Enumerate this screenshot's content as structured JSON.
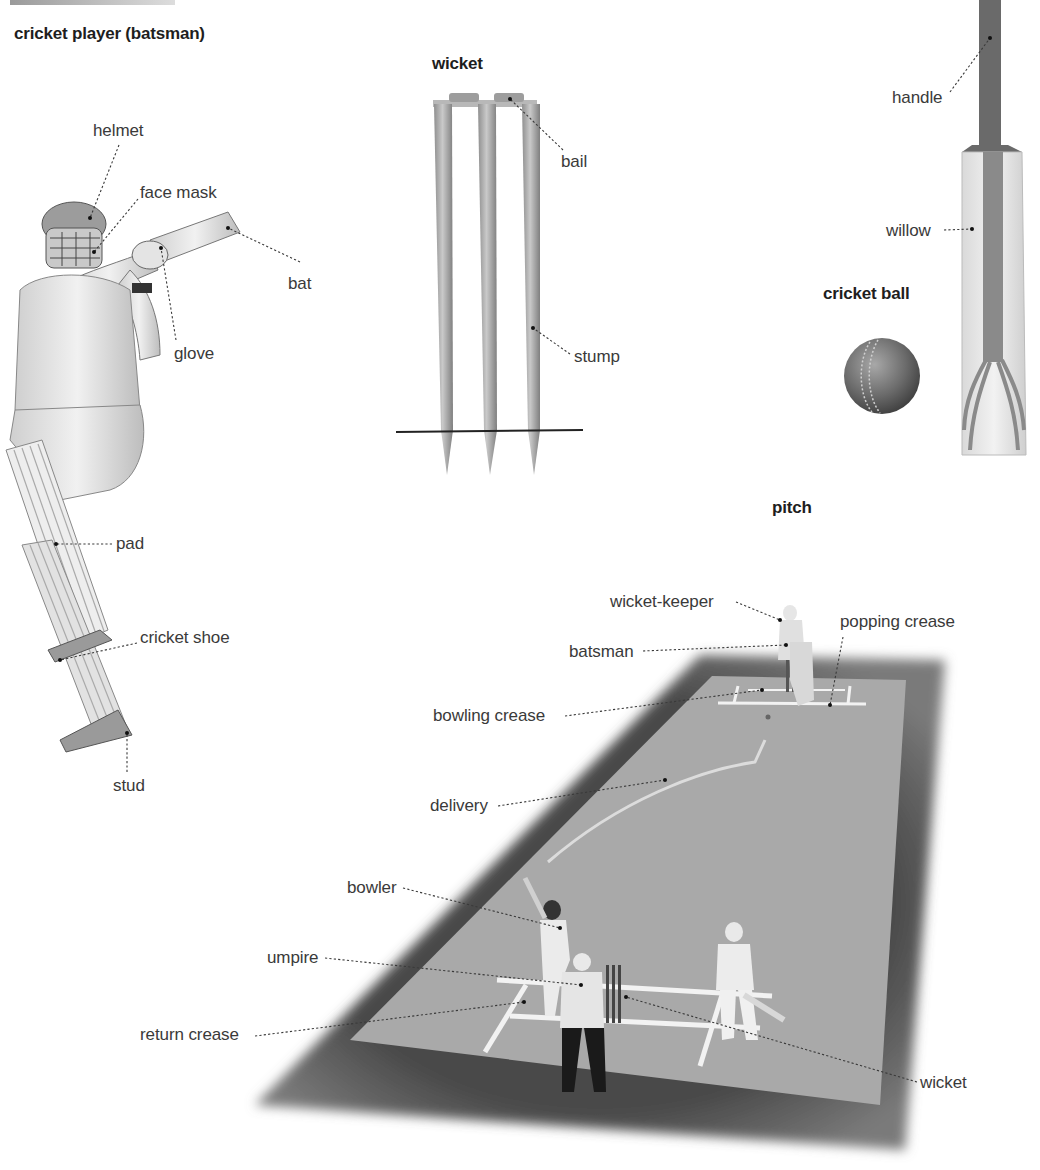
{
  "page": {
    "sections": {
      "batsman": {
        "title": "cricket player (batsman)"
      },
      "wicket": {
        "title": "wicket"
      },
      "ball": {
        "title": "cricket ball"
      },
      "pitch": {
        "title": "pitch"
      }
    },
    "labels": {
      "helmet": "helmet",
      "face_mask": "face mask",
      "bat": "bat",
      "glove": "glove",
      "pad": "pad",
      "cricket_shoe": "cricket shoe",
      "stud": "stud",
      "bail": "bail",
      "stump": "stump",
      "handle": "handle",
      "willow": "willow",
      "wicket_keeper": "wicket-keeper",
      "batsman": "batsman",
      "popping_crease": "popping crease",
      "bowling_crease": "bowling crease",
      "delivery": "delivery",
      "bowler": "bowler",
      "umpire": "umpire",
      "return_crease": "return crease",
      "wicket": "wicket"
    },
    "colors": {
      "text": "#3a3a3a",
      "heading": "#1e1e1e",
      "pitch_surface": "#a9a9a9",
      "outfield_border": "#555555",
      "crease_lines": "#f2f2f2"
    }
  }
}
